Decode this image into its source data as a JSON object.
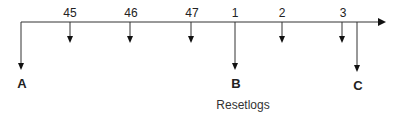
{
  "diagram": {
    "type": "timeline",
    "axis": {
      "direction": "right",
      "y": 22,
      "x_start": 21,
      "x_end": 385
    },
    "ticks": [
      {
        "label": "45",
        "x": 70
      },
      {
        "label": "46",
        "x": 130
      },
      {
        "label": "47",
        "x": 191
      },
      {
        "label": "1",
        "x": 235
      },
      {
        "label": "2",
        "x": 282
      },
      {
        "label": "3",
        "x": 342
      }
    ],
    "markers": [
      {
        "label": "A",
        "x": 21
      },
      {
        "label": "B",
        "x": 235
      },
      {
        "label": "C",
        "x": 357
      }
    ],
    "caption": "Resetlogs"
  }
}
